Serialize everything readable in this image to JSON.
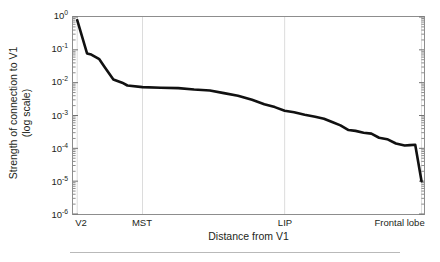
{
  "chart_data": {
    "type": "line",
    "title": "",
    "xlabel": "Distance from V1",
    "ylabel": "Strength of connection to V1 (log scale)",
    "ylabel_lines": [
      "Strength of connection to V1",
      "(log scale)"
    ],
    "yscale": "log",
    "ylim": [
      1e-06,
      1
    ],
    "ytick_values": [
      1,
      0.1,
      0.01,
      0.001,
      0.0001,
      1e-05,
      1e-06
    ],
    "ytick_labels": [
      "10",
      "10",
      "10",
      "10",
      "10",
      "10",
      "10"
    ],
    "ytick_exponents": [
      "0",
      "-1",
      "-2",
      "-3",
      "-4",
      "-5",
      "-6"
    ],
    "xlim": [
      0,
      1
    ],
    "xtick_positions": [
      0.012,
      0.198,
      0.603,
      0.993
    ],
    "xtick_labels": [
      "V2",
      "MST",
      "LIP",
      "Frontal lobe"
    ],
    "grid": "vertical-only",
    "legend": "none",
    "line_color": "#111111",
    "line_width": 2.6,
    "series": [
      {
        "name": "Strength of connection to V1",
        "x": [
          0.012,
          0.04,
          0.052,
          0.075,
          0.09,
          0.115,
          0.14,
          0.155,
          0.198,
          0.25,
          0.3,
          0.345,
          0.39,
          0.43,
          0.47,
          0.51,
          0.545,
          0.575,
          0.603,
          0.63,
          0.66,
          0.69,
          0.715,
          0.74,
          0.762,
          0.785,
          0.805,
          0.828,
          0.85,
          0.872,
          0.895,
          0.92,
          0.945,
          0.96,
          0.975,
          0.993
        ],
        "y": [
          0.8,
          0.078,
          0.072,
          0.052,
          0.03,
          0.0125,
          0.01,
          0.0082,
          0.0073,
          0.007,
          0.0068,
          0.0062,
          0.0058,
          0.0048,
          0.004,
          0.003,
          0.0022,
          0.0018,
          0.0014,
          0.00125,
          0.00105,
          0.00092,
          0.0008,
          0.00062,
          0.0005,
          0.00036,
          0.00034,
          0.0003,
          0.00028,
          0.00021,
          0.00019,
          0.00014,
          0.000122,
          0.000125,
          0.000128,
          1e-05
        ]
      }
    ]
  },
  "axes": {
    "x_title": "Distance from V1",
    "y_title_line1": "Strength of connection to V1",
    "y_title_line2": "(log scale)"
  }
}
